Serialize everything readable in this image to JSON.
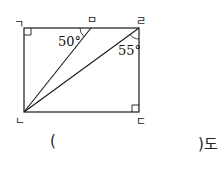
{
  "diagram": {
    "type": "rectangle-with-diagonal-lines",
    "vertices": {
      "top_left": "ㄱ",
      "bottom_left": "ㄴ",
      "bottom_right": "ㄷ",
      "top_right": "ㄹ",
      "top_point": "ㅁ"
    },
    "angles": {
      "angle_at_m": "50°",
      "angle_at_r": "55°"
    },
    "right_angle_marks": [
      "ㄱ",
      "ㄷ"
    ],
    "line_color": "#1a1a1a"
  },
  "answer": {
    "open_paren": "(",
    "close_paren_suffix": ")도"
  }
}
